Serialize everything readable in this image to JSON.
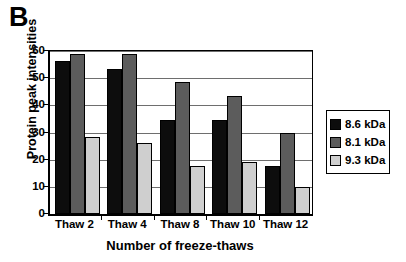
{
  "panel": {
    "label": "B"
  },
  "chart_data": {
    "type": "bar",
    "title": "",
    "subtitle": "",
    "xlabel": "Number of freeze-thaws",
    "ylabel": "Protein peak intensities",
    "categories": [
      "Thaw 2",
      "Thaw 4",
      "Thaw 8",
      "Thaw 10",
      "Thaw 12"
    ],
    "series": [
      {
        "name": "8.6 kDa",
        "color": "#0d0d0d",
        "values": [
          56.5,
          53.5,
          34.5,
          34.5,
          17.5
        ]
      },
      {
        "name": "8.1 kDa",
        "color": "#5c5c5c",
        "values": [
          59.0,
          59.0,
          48.5,
          43.5,
          30.0
        ]
      },
      {
        "name": "9.3 kDa",
        "color": "#cfcfcf",
        "values": [
          28.5,
          26.0,
          17.5,
          19.0,
          10.0
        ]
      }
    ],
    "ylim": [
      0,
      60
    ],
    "yticks": [
      0,
      10,
      20,
      30,
      40,
      50,
      60
    ],
    "ytick_labels": [
      "0",
      "10",
      "20",
      "30",
      "40",
      "50",
      "60"
    ],
    "grid": "horizontal",
    "legend_position": "right",
    "legend_entries": [
      "8.6 kDa",
      "8.1 kDa",
      "9.3 kDa"
    ],
    "annotations": []
  }
}
